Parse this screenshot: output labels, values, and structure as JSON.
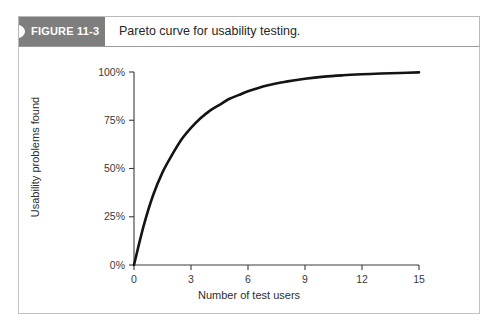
{
  "figure": {
    "tab_label": "FIGURE 11-3",
    "caption": "Pareto curve for usability testing.",
    "tab_color": "#7e7e7e",
    "tab_text_color": "#ffffff",
    "border_color": "#c3c3c3"
  },
  "chart_data": {
    "type": "line",
    "title": "",
    "subtitle": "",
    "xlabel": "Number of test users",
    "ylabel": "Usability problems found",
    "xlim": [
      0,
      15
    ],
    "ylim": [
      0,
      100
    ],
    "xticks": [
      0,
      3,
      6,
      9,
      12,
      15
    ],
    "xtick_labels": [
      "0",
      "3",
      "6",
      "9",
      "12",
      "15"
    ],
    "yticks": [
      0,
      25,
      50,
      75,
      100
    ],
    "ytick_labels": [
      "0%",
      "25%",
      "50%",
      "75%",
      "100%"
    ],
    "grid": false,
    "legend": false,
    "legend_position": "none",
    "line_color": "#141414",
    "series": [
      {
        "name": "Usability problems found",
        "x": [
          0,
          0.5,
          1,
          1.5,
          2,
          2.5,
          3,
          3.5,
          4,
          4.5,
          5,
          5.5,
          6,
          7,
          8,
          9,
          10,
          11,
          12,
          13,
          14,
          15
        ],
        "values": [
          0,
          20,
          36,
          48,
          57,
          65,
          71,
          76,
          80,
          83,
          86,
          88,
          90,
          93,
          95,
          96.5,
          97.6,
          98.3,
          98.8,
          99.2,
          99.5,
          99.8
        ]
      }
    ],
    "annotations": []
  }
}
